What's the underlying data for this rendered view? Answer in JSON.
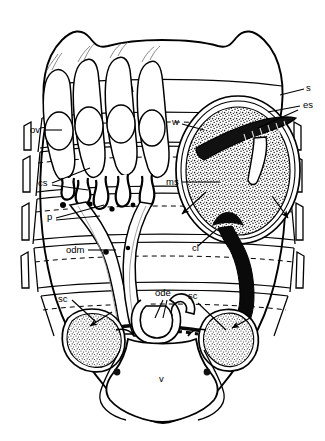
{
  "figure": {
    "background_color": "#ffffff",
    "ink_color": "#000000",
    "stipple_color": "#000000",
    "width": 325,
    "height": 441
  },
  "labels": [
    {
      "id": "ov",
      "text": "ov",
      "x": 30,
      "y": 133,
      "anchor": "start",
      "meaning": "ovary / ovum"
    },
    {
      "id": "cs",
      "text": "cs",
      "x": 38,
      "y": 186,
      "anchor": "start",
      "meaning": "connecting stalk / pedicel cluster"
    },
    {
      "id": "p",
      "text": "p",
      "x": 47,
      "y": 220,
      "anchor": "start",
      "meaning": "pedicel"
    },
    {
      "id": "w",
      "text": "w",
      "x": 172,
      "y": 125,
      "anchor": "start",
      "meaning": "wall of sperm mass sac"
    },
    {
      "id": "ms",
      "text": "ms",
      "x": 166,
      "y": 185,
      "anchor": "start",
      "meaning": "sperm mass"
    },
    {
      "id": "s",
      "text": "s",
      "x": 306,
      "y": 91,
      "anchor": "start",
      "meaning": "spermatophore"
    },
    {
      "id": "es",
      "text": "es",
      "x": 303,
      "y": 108,
      "anchor": "start",
      "meaning": "ejaculatory sac / endospermatophore"
    },
    {
      "id": "cl",
      "text": "cl",
      "x": 192,
      "y": 251,
      "anchor": "start",
      "meaning": "cleft / common duct lumen"
    },
    {
      "id": "odm",
      "text": "odm",
      "x": 66,
      "y": 253,
      "anchor": "start",
      "meaning": "oviduct / median oviduct"
    },
    {
      "id": "ode",
      "text": "ode",
      "x": 155,
      "y": 296,
      "anchor": "start",
      "meaning": "oviduct entrance / ejaculatory duct opening"
    },
    {
      "id": "sc-left",
      "text": "sc",
      "x": 58,
      "y": 302,
      "anchor": "start",
      "meaning": "spermathecal capsule (left)"
    },
    {
      "id": "sc-right",
      "text": "sc",
      "x": 188,
      "y": 299,
      "anchor": "start",
      "meaning": "spermathecal capsule (right)"
    },
    {
      "id": "v",
      "text": "v",
      "x": 159,
      "y": 382,
      "anchor": "start",
      "meaning": "vagina / vulva"
    }
  ],
  "structures": {
    "body_outline": "idiosoma outline, bilobed anterior, tapering V-shaped posterior",
    "ovary_tubes": 4,
    "ova_per_tube": 1,
    "segment_bands": 5,
    "sperm_mass": {
      "shape": "ellipse",
      "stippled": true,
      "cx": 238,
      "cy": 170,
      "rx": 60,
      "ry": 72
    },
    "spermathecal_capsules": 2,
    "dark_duct": "thick black cleft duct running from sperm mass to right spermathecal capsule"
  }
}
